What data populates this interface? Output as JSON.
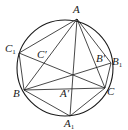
{
  "diagram": {
    "type": "geometry",
    "stroke_color": "#1a1a1a",
    "circle": {
      "cx": 65,
      "cy": 68,
      "r": 48
    },
    "points": {
      "A": {
        "x": 77,
        "y": 19
      },
      "B": {
        "x": 24,
        "y": 90
      },
      "C": {
        "x": 105,
        "y": 88
      },
      "A1": {
        "x": 70,
        "y": 116
      },
      "B1": {
        "x": 111,
        "y": 63
      },
      "C1": {
        "x": 19,
        "y": 53
      }
    },
    "segments": [
      [
        "A",
        "B"
      ],
      [
        "A",
        "C"
      ],
      [
        "B",
        "C"
      ],
      [
        "A",
        "A1"
      ],
      [
        "B",
        "B1"
      ],
      [
        "C",
        "C1"
      ],
      [
        "A",
        "C1"
      ],
      [
        "A",
        "B1"
      ],
      [
        "B",
        "A1"
      ],
      [
        "C",
        "A1"
      ],
      [
        "B",
        "C1"
      ],
      [
        "C",
        "B1"
      ]
    ],
    "labels": [
      {
        "id": "A",
        "text": "A",
        "sub": "",
        "prime": "",
        "x": 73,
        "y": 4
      },
      {
        "id": "C1",
        "text": "C",
        "sub": "1",
        "prime": "",
        "x": 5,
        "y": 43
      },
      {
        "id": "Cp",
        "text": "C",
        "sub": "",
        "prime": "′",
        "x": 37,
        "y": 49
      },
      {
        "id": "Bp",
        "text": "B",
        "sub": "",
        "prime": "′",
        "x": 96,
        "y": 53
      },
      {
        "id": "B1",
        "text": "B",
        "sub": "1",
        "prime": "",
        "x": 112,
        "y": 56
      },
      {
        "id": "B",
        "text": "B",
        "sub": "",
        "prime": "",
        "x": 13,
        "y": 88
      },
      {
        "id": "Ap",
        "text": "A",
        "sub": "",
        "prime": "′",
        "x": 60,
        "y": 88
      },
      {
        "id": "C",
        "text": "C",
        "sub": "",
        "prime": "",
        "x": 107,
        "y": 86
      },
      {
        "id": "A1",
        "text": "A",
        "sub": "1",
        "prime": "",
        "x": 64,
        "y": 118
      }
    ]
  }
}
